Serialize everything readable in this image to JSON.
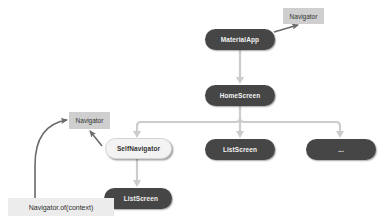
{
  "diagram": {
    "title": "",
    "colors": {
      "dark_node": "#464646",
      "light_node": "#f3f3f3",
      "label_box": "#cfcfcf",
      "call_box": "#ececec",
      "tree_edge": "#cccccc",
      "ref_arrow": "#6a6a6a"
    },
    "nodes": {
      "material_app": "MaterialApp",
      "home_screen": "HomeScreen",
      "self_navigator": "SelfNavigator",
      "list_screen_middle": "ListScreen",
      "ellipsis_node": "...",
      "list_screen_bottom": "ListScreen"
    },
    "labels": {
      "navigator_top": "Navigator",
      "navigator_left": "Navigator",
      "navigator_of_context": "Navigator.of(context)"
    },
    "edges": [
      {
        "from": "MaterialApp",
        "to": "Navigator",
        "style": "reference"
      },
      {
        "from": "MaterialApp",
        "to": "HomeScreen",
        "style": "tree"
      },
      {
        "from": "HomeScreen",
        "to": "SelfNavigator",
        "style": "tree"
      },
      {
        "from": "HomeScreen",
        "to": "ListScreen",
        "style": "tree"
      },
      {
        "from": "HomeScreen",
        "to": "...",
        "style": "tree"
      },
      {
        "from": "SelfNavigator",
        "to": "ListScreen",
        "style": "tree"
      },
      {
        "from": "SelfNavigator",
        "to": "Navigator",
        "style": "reference"
      },
      {
        "from": "Navigator.of(context)",
        "to": "Navigator",
        "style": "reference"
      }
    ]
  }
}
